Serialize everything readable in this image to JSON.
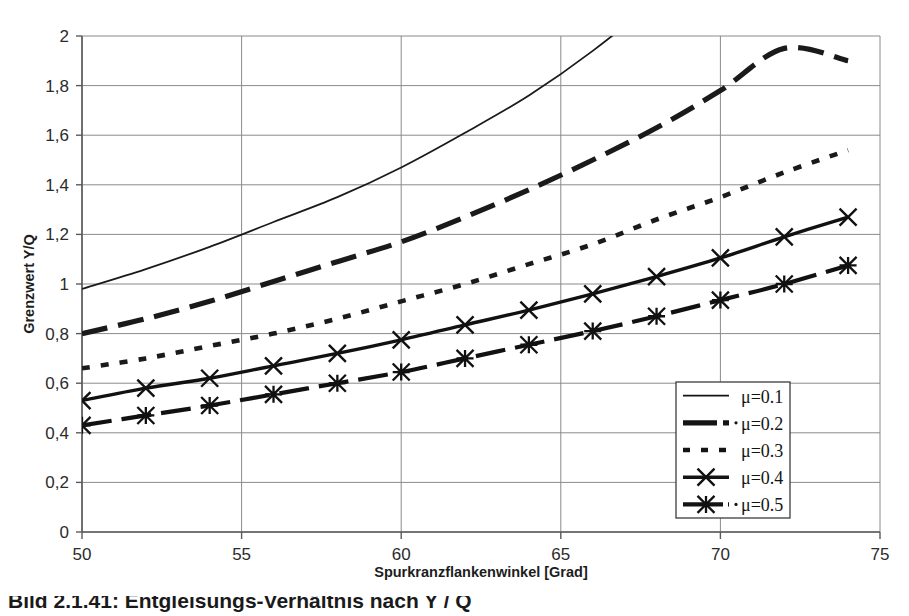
{
  "chart_data": {
    "type": "line",
    "title": "",
    "xlabel": "Spurkranzflankenwinkel [Grad]",
    "ylabel": "Grenzwert Y/Q",
    "xlim": [
      50,
      75
    ],
    "ylim": [
      0,
      2
    ],
    "xticks": [
      50,
      55,
      60,
      65,
      70,
      75
    ],
    "yticks": [
      0,
      0.2,
      0.4,
      0.6,
      0.8,
      1,
      1.2,
      1.4,
      1.6,
      1.8,
      2
    ],
    "xtick_labels": [
      "50",
      "55",
      "60",
      "65",
      "70",
      "75"
    ],
    "ytick_labels": [
      "0",
      "0,2",
      "0,4",
      "0,6",
      "0,8",
      "1",
      "1,2",
      "1,4",
      "1,6",
      "1,8",
      "2"
    ],
    "grid": true,
    "legend_position": "lower-right",
    "x": [
      50,
      52,
      54,
      56,
      58,
      60,
      62,
      64,
      66,
      68,
      70,
      72,
      74
    ],
    "series": [
      {
        "name": "μ=0.1",
        "style": "solid-thin",
        "marker": "none",
        "color": "#1a1a1a",
        "values": [
          0.98,
          1.06,
          1.15,
          1.25,
          1.35,
          1.47,
          1.61,
          1.76,
          1.94,
          2.15,
          2.4,
          2.68,
          3.02
        ],
        "clipped_at_top_x": 69.5
      },
      {
        "name": "μ=0.2",
        "style": "long-dash",
        "marker": "none",
        "color": "#1a1a1a",
        "values": [
          0.8,
          0.86,
          0.93,
          1.01,
          1.09,
          1.17,
          1.27,
          1.38,
          1.5,
          1.63,
          1.78,
          1.95,
          1.9
        ]
      },
      {
        "name": "μ=0.3",
        "style": "dotted-square",
        "marker": "none",
        "color": "#1a1a1a",
        "values": [
          0.66,
          0.7,
          0.75,
          0.8,
          0.86,
          0.93,
          1.0,
          1.08,
          1.16,
          1.26,
          1.35,
          1.45,
          1.54
        ]
      },
      {
        "name": "μ=0.4",
        "style": "solid-thick",
        "marker": "x",
        "color": "#111111",
        "values": [
          0.53,
          0.58,
          0.62,
          0.67,
          0.72,
          0.775,
          0.835,
          0.895,
          0.96,
          1.03,
          1.105,
          1.19,
          1.27
        ]
      },
      {
        "name": "μ=0.5",
        "style": "dash-dot-thick",
        "marker": "asterisk",
        "color": "#111111",
        "values": [
          0.43,
          0.47,
          0.51,
          0.555,
          0.6,
          0.645,
          0.7,
          0.755,
          0.81,
          0.87,
          0.935,
          1.0,
          1.075
        ]
      }
    ],
    "legend_entries": [
      {
        "label": "μ=0.1",
        "style": "solid-thin",
        "marker": "none"
      },
      {
        "label": "μ=0.2",
        "style": "long-dash",
        "marker": "none"
      },
      {
        "label": "μ=0.3",
        "style": "dotted-square",
        "marker": "none"
      },
      {
        "label": "μ=0.4",
        "style": "solid-thick",
        "marker": "x"
      },
      {
        "label": "μ=0.5",
        "style": "dash-dot-thick",
        "marker": "asterisk"
      }
    ]
  },
  "caption": {
    "text": "Bild 2.1.41: Entgleisungs-Verhältnis nach Y / Q"
  },
  "colors": {
    "grid": "#8a8a8a",
    "axis": "#555555",
    "curve": "#141414",
    "text": "#1d1d1d",
    "background": "#ffffff"
  }
}
